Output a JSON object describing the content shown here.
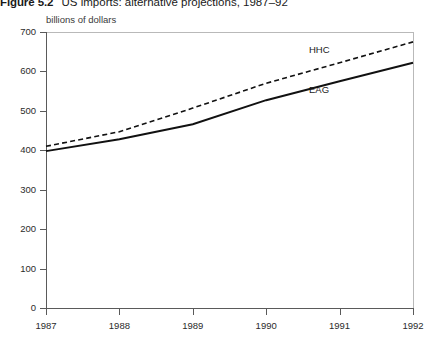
{
  "title": {
    "figure_number": "Figure 5.2",
    "caption": "US imports: alternative projections, 1987–92"
  },
  "axis_unit_label": "billions of dollars",
  "series_labels": {
    "hhc": "HHC",
    "eag": "EAG"
  },
  "chart_data": {
    "type": "line",
    "title": "Figure 5.2  US imports: alternative projections, 1987–92",
    "xlabel": "",
    "ylabel": "billions of dollars",
    "categories": [
      "1987",
      "1988",
      "1989",
      "1990",
      "1991",
      "1992"
    ],
    "x": [
      1987,
      1988,
      1989,
      1990,
      1991,
      1992
    ],
    "xlim": [
      1987,
      1992
    ],
    "ylim": [
      0,
      700
    ],
    "yticks": [
      0,
      100,
      200,
      300,
      400,
      500,
      600,
      700
    ],
    "ytick_labels": [
      "0",
      "100",
      "200",
      "300",
      "400",
      "500",
      "600",
      "700"
    ],
    "xticks": [
      1987,
      1988,
      1989,
      1990,
      1991,
      1992
    ],
    "xtick_labels": [
      "1987",
      "1988",
      "1989",
      "1990",
      "1991",
      "1992"
    ],
    "grid": false,
    "legend": "inline-labels",
    "series": [
      {
        "name": "HHC",
        "style": "dashed",
        "color": "#000000",
        "values": [
          410,
          447,
          507,
          570,
          622,
          675
        ]
      },
      {
        "name": "EAG",
        "style": "solid",
        "color": "#000000",
        "values": [
          398,
          428,
          466,
          527,
          575,
          622
        ]
      }
    ],
    "annotations": [
      {
        "text": "HHC",
        "series": "HHC",
        "x": 1991.0,
        "y": 622
      },
      {
        "text": "EAG",
        "series": "EAG",
        "x": 1991.0,
        "y": 575
      }
    ]
  }
}
